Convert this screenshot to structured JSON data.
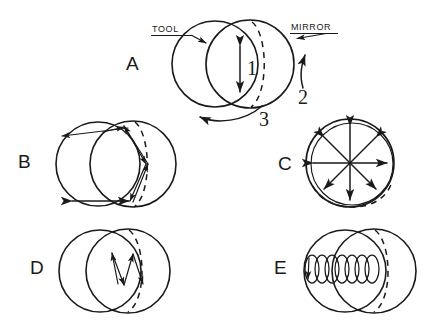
{
  "figure": {
    "type": "technical-line-diagram",
    "background_color": "#ffffff",
    "ink_color": "#1a1a1a",
    "panel_count": 5
  },
  "panels": [
    {
      "id": "A",
      "letter": "A",
      "description": "Two overlapping circles (tool over mirror) with vertical double-headed stroke arrow, rotation arrow beneath, and leader-line callouts",
      "callouts": [
        {
          "name": "tool",
          "text": "TOOL",
          "underlined": true,
          "side": "left"
        },
        {
          "name": "mirror",
          "text": "MIRROR",
          "underlined": true,
          "side": "right"
        }
      ],
      "numbers": [
        {
          "name": "motion-1",
          "text": "1",
          "meaning": "stroke (vertical oscillation)"
        },
        {
          "name": "motion-2",
          "text": "2",
          "meaning": "mirror rotation (arrow up)"
        },
        {
          "name": "motion-3",
          "text": "3",
          "meaning": "tool rotation (curved arrow)"
        }
      ]
    },
    {
      "id": "B",
      "letter": "B",
      "description": "Overlapping circles with long zigzag chordal stroke arrows and horizontal double-headed arrows"
    },
    {
      "id": "C",
      "letter": "C",
      "description": "Single circle with dashed inner arc and eight radial double-headed arrows forming a starburst"
    },
    {
      "id": "D",
      "letter": "D",
      "description": "Overlapping circles with short W-shaped zigzag stroke arrows at center"
    },
    {
      "id": "E",
      "letter": "E",
      "description": "Overlapping circles with a horizontal helical coil / spiral stroke terminating in an arrow at the left"
    }
  ],
  "labels": {
    "panel_a": "A",
    "panel_b": "B",
    "panel_c": "C",
    "panel_d": "D",
    "panel_e": "E",
    "tool": "TOOL",
    "mirror": "MIRROR",
    "one": "1",
    "two": "2",
    "three": "3"
  }
}
